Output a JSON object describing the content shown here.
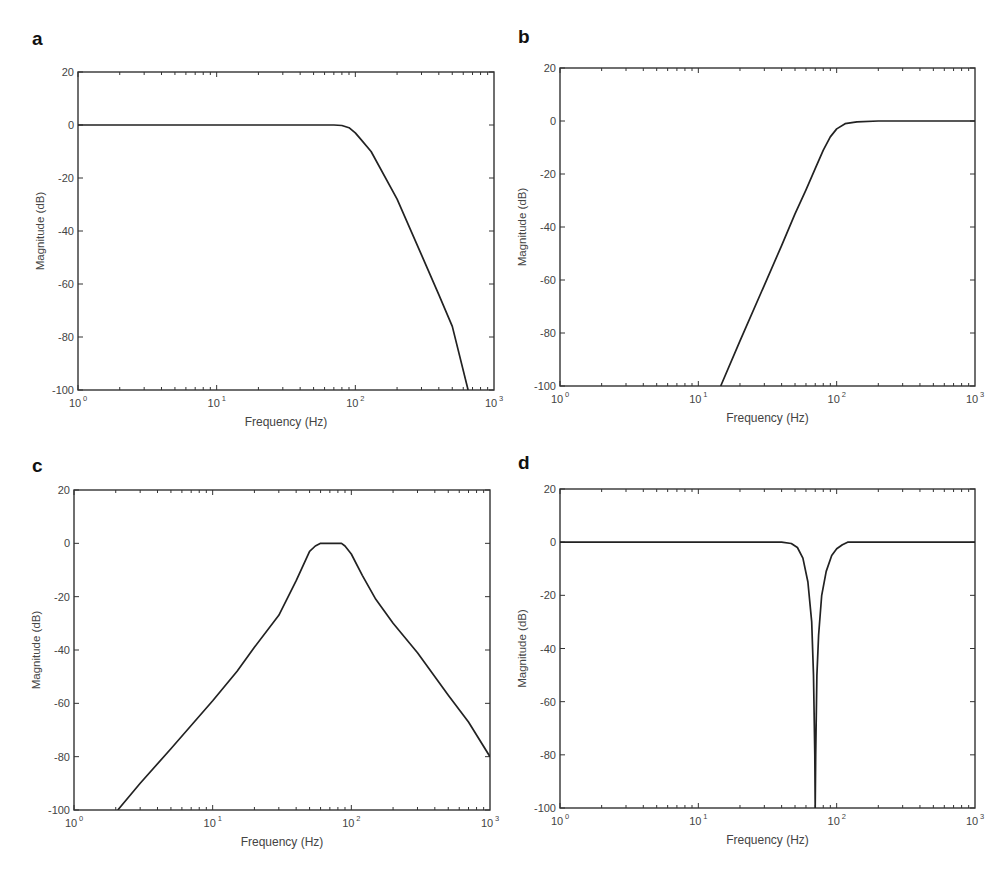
{
  "figure": {
    "panels": [
      {
        "id": "a",
        "label": "a",
        "type": "low-pass"
      },
      {
        "id": "b",
        "label": "b",
        "type": "high-pass"
      },
      {
        "id": "c",
        "label": "c",
        "type": "band-pass"
      },
      {
        "id": "d",
        "label": "d",
        "type": "band-stop (notch)"
      }
    ]
  },
  "chart_data": [
    {
      "panel": "a",
      "type": "line",
      "title": "",
      "xlabel": "Frequency  (Hz)",
      "ylabel": "Magnitude (dB)",
      "xscale": "log",
      "xlim": [
        1,
        1000
      ],
      "ylim": [
        -100,
        20
      ],
      "xticks": [
        1,
        10,
        100,
        1000
      ],
      "xtick_labels": [
        "10^0",
        "10^1",
        "10^2",
        "10^3"
      ],
      "yticks": [
        20,
        0,
        -20,
        -40,
        -60,
        -80,
        -100
      ],
      "ytick_labels": [
        "20",
        "0",
        "-20",
        "-40",
        "-60",
        "-80",
        "-100"
      ],
      "grid": false,
      "legend": null,
      "series": [
        {
          "name": "Low-pass response",
          "x": [
            1,
            10,
            50,
            70,
            80,
            90,
            100,
            110,
            130,
            200,
            300,
            400,
            500,
            650
          ],
          "y": [
            0,
            0,
            0,
            0,
            -0.2,
            -1,
            -3,
            -5.5,
            -10,
            -28,
            -49,
            -64,
            -76,
            -100
          ]
        }
      ]
    },
    {
      "panel": "b",
      "type": "line",
      "title": "",
      "xlabel": "Frequency  (Hz)",
      "ylabel": "Magnitude (dB)",
      "xscale": "log",
      "xlim": [
        1,
        1000
      ],
      "ylim": [
        -100,
        20
      ],
      "xticks": [
        1,
        10,
        100,
        1000
      ],
      "xtick_labels": [
        "10^0",
        "10^1",
        "10^2",
        "10^3"
      ],
      "yticks": [
        20,
        0,
        -20,
        -40,
        -60,
        -80,
        -100
      ],
      "ytick_labels": [
        "20",
        "0",
        "-20",
        "-40",
        "-60",
        "-80",
        "-100"
      ],
      "grid": false,
      "legend": null,
      "series": [
        {
          "name": "High-pass response",
          "x": [
            14.5,
            20,
            30,
            40,
            50,
            60,
            70,
            80,
            90,
            100,
            115,
            140,
            200,
            1000
          ],
          "y": [
            -100,
            -83,
            -62,
            -47,
            -35,
            -26,
            -18,
            -11,
            -6,
            -3,
            -1,
            -0.3,
            0,
            0
          ]
        }
      ]
    },
    {
      "panel": "c",
      "type": "line",
      "title": "",
      "xlabel": "Frequency  (Hz)",
      "ylabel": "Magnitude (dB)",
      "xscale": "log",
      "xlim": [
        1,
        1000
      ],
      "ylim": [
        -100,
        20
      ],
      "xticks": [
        1,
        10,
        100,
        1000
      ],
      "xtick_labels": [
        "10^0",
        "10^1",
        "10^2",
        "10^3"
      ],
      "yticks": [
        20,
        0,
        -20,
        -40,
        -60,
        -80,
        -100
      ],
      "ytick_labels": [
        "20",
        "0",
        "-20",
        "-40",
        "-60",
        "-80",
        "-100"
      ],
      "grid": false,
      "legend": null,
      "series": [
        {
          "name": "Band-pass response",
          "x": [
            2.07,
            3,
            5,
            10,
            15,
            20,
            30,
            40,
            50,
            55,
            60,
            70,
            85,
            90,
            100,
            120,
            150,
            200,
            300,
            500,
            700,
            1000
          ],
          "y": [
            -100,
            -90,
            -77,
            -59,
            -48,
            -39,
            -27,
            -14,
            -3,
            -1,
            0,
            0,
            0,
            -1,
            -4,
            -12,
            -21,
            -30,
            -41,
            -57,
            -67,
            -80
          ]
        }
      ]
    },
    {
      "panel": "d",
      "type": "line",
      "title": "",
      "xlabel": "Frequency  (Hz)",
      "ylabel": "Magnitude (dB)",
      "xscale": "log",
      "xlim": [
        1,
        1000
      ],
      "ylim": [
        -100,
        20
      ],
      "xticks": [
        1,
        10,
        100,
        1000
      ],
      "xtick_labels": [
        "10^0",
        "10^1",
        "10^2",
        "10^3"
      ],
      "yticks": [
        20,
        0,
        -20,
        -40,
        -60,
        -80,
        -100
      ],
      "ytick_labels": [
        "20",
        "0",
        "-20",
        "-40",
        "-60",
        "-80",
        "-100"
      ],
      "grid": false,
      "legend": null,
      "series": [
        {
          "name": "Notch response",
          "x": [
            1,
            10,
            40,
            47,
            52,
            57,
            62,
            66,
            68,
            69.5,
            70,
            70.5,
            72,
            74,
            78,
            84,
            92,
            100,
            110,
            120,
            1000
          ],
          "y": [
            0,
            0,
            0,
            -0.5,
            -2,
            -6,
            -15,
            -30,
            -50,
            -80,
            -100,
            -80,
            -50,
            -35,
            -20,
            -11,
            -5,
            -2.5,
            -1,
            0,
            0
          ]
        }
      ]
    }
  ],
  "style": {
    "line_color": "#222222",
    "axis_color": "#333333",
    "text_color": "#444444",
    "background": "#ffffff"
  }
}
